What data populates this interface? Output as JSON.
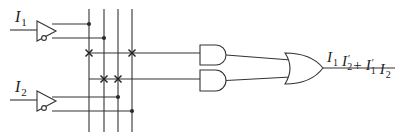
{
  "diagram": {
    "type": "logic-circuit",
    "inputs": [
      {
        "name": "I",
        "sub": "1",
        "line_y": 30,
        "label_x": 15,
        "label_y": 22,
        "buf_x": 37,
        "buf_top": 21,
        "buf_bot": 41,
        "out_true_y": 24,
        "out_comp_y": 38
      },
      {
        "name": "I",
        "sub": "2",
        "line_y": 100,
        "label_x": 15,
        "label_y": 92,
        "buf_x": 37,
        "buf_top": 91,
        "buf_bot": 111,
        "out_true_y": 97,
        "out_comp_y": 111
      }
    ],
    "verticals": [
      {
        "id": "I1",
        "x": 89
      },
      {
        "id": "I1'",
        "x": 104
      },
      {
        "id": "I2",
        "x": 118
      },
      {
        "id": "I2'",
        "x": 132
      }
    ],
    "vertical_top": 9,
    "vertical_bottom": 132,
    "buffer_connections": [
      {
        "from_y": 24,
        "to_vertical": 0,
        "label": "I1 true"
      },
      {
        "from_y": 38,
        "to_vertical": 1,
        "label": "I1 complement"
      },
      {
        "from_y": 97,
        "to_vertical": 2,
        "label": "I2 true"
      },
      {
        "from_y": 111,
        "to_vertical": 3,
        "label": "I2 complement"
      }
    ],
    "product_terms": [
      {
        "term": "I1 I2'",
        "y": 53,
        "fuses": [
          0,
          3
        ],
        "gate_y_top": 45,
        "gate_y_bot": 65
      },
      {
        "term": "I1' I2",
        "y": 79,
        "fuses": [
          1,
          2
        ],
        "gate_y_top": 70,
        "gate_y_bot": 91
      }
    ],
    "and_gate_x": 200,
    "and_gate_width": 26,
    "or_gate": {
      "x": 285,
      "y_top": 53,
      "y_bot": 84,
      "tip_x": 323,
      "out_y": 68
    },
    "output": {
      "line_end_x": 395,
      "label_parts": [
        {
          "text": "I",
          "sub": "1",
          "prime": ""
        },
        {
          "text": "I",
          "sub": "2",
          "prime": "′"
        },
        {
          "text": "+",
          "sub": "",
          "prime": ""
        },
        {
          "text": "I",
          "sub": "1",
          "prime": "′"
        },
        {
          "text": "I",
          "sub": "2",
          "prime": ""
        }
      ],
      "label_text": "I1 I2′ + I1′ I2",
      "label_x": 327,
      "label_y": 62
    }
  }
}
